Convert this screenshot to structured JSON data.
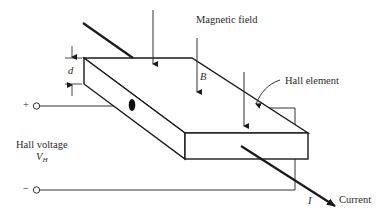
{
  "figure": {
    "labels": {
      "magnetic_field": "Magnetic field",
      "b_symbol": "B",
      "hall_element": "Hall element",
      "d_symbol": "d",
      "plus_sign": "+",
      "minus_sign": "−",
      "hall_voltage": "Hall voltage",
      "vh_symbol": "V",
      "vh_subscript": "H",
      "i_symbol": "I",
      "current": "Current"
    },
    "colors": {
      "stroke": "#1a1a1a",
      "background": "#ffffff"
    }
  }
}
